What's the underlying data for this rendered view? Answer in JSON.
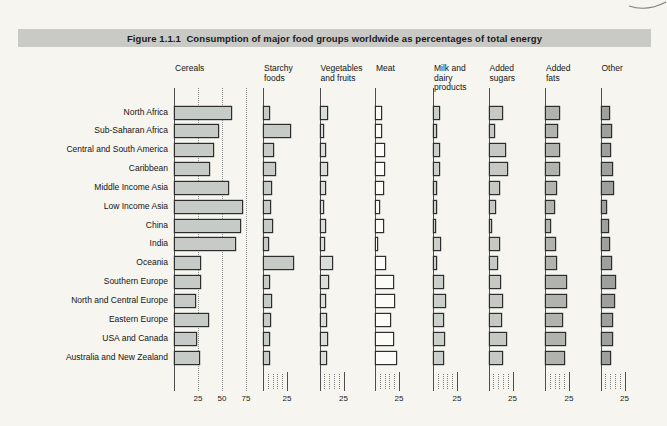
{
  "figure": {
    "title": "Figure 1.1.1  Consumption of major food groups worldwide as percentages of total energy"
  },
  "chart_data": {
    "type": "bar",
    "orientation": "horizontal",
    "unit": "% of total energy",
    "layout": "small-multiples, one column per food group, shared region rows",
    "categories": [
      "North Africa",
      "Sub-Saharan Africa",
      "Central and South America",
      "Caribbean",
      "Middle Income Asia",
      "Low Income Asia",
      "China",
      "India",
      "Oceania",
      "Southern Europe",
      "North and Central Europe",
      "Eastern Europe",
      "USA and Canada",
      "Australia and New Zealand"
    ],
    "series": [
      {
        "name": "Cereals",
        "label": "Cereals",
        "fill": "#c7cbc7",
        "axis_max": 80,
        "tick_labels": [
          25,
          50,
          75
        ],
        "values": [
          58,
          45,
          40,
          35,
          55,
          70,
          68,
          62,
          26,
          26,
          21,
          34,
          22,
          25
        ]
      },
      {
        "name": "Starchy foods",
        "label": "Starchy\nfoods",
        "fill": "#c7cbc7",
        "axis_max": 32,
        "tick_labels": [
          25
        ],
        "values": [
          5,
          27,
          9,
          11,
          7,
          6,
          8,
          4,
          30,
          5,
          7,
          6,
          5,
          5
        ]
      },
      {
        "name": "Vegetables and fruits",
        "label": "Vegetables\nand fruits",
        "fill": "#dadeda",
        "axis_max": 32,
        "tick_labels": [
          25
        ],
        "values": [
          7,
          3,
          5,
          7,
          5,
          3,
          5,
          4,
          12,
          8,
          5,
          6,
          7,
          6
        ]
      },
      {
        "name": "Meat",
        "label": "Meat",
        "fill": "#fbfbf7",
        "axis_max": 32,
        "tick_labels": [
          25
        ],
        "values": [
          5,
          5,
          8,
          8,
          7,
          3,
          7,
          1,
          9,
          18,
          19,
          15,
          18,
          21
        ]
      },
      {
        "name": "Milk and dairy products",
        "label": "Milk and\ndairy\nproducts",
        "fill": "#cbcfcb",
        "axis_max": 32,
        "tick_labels": [
          25
        ],
        "values": [
          5,
          2,
          5,
          5,
          2,
          2,
          1,
          6,
          2,
          9,
          11,
          9,
          10,
          9
        ]
      },
      {
        "name": "Added sugars",
        "label": "Added\nsugars",
        "fill": "#c6c8c4",
        "axis_max": 32,
        "tick_labels": [
          25
        ],
        "values": [
          13,
          5,
          16,
          18,
          10,
          6,
          2,
          10,
          8,
          11,
          13,
          12,
          17,
          13
        ]
      },
      {
        "name": "Added fats",
        "label": "Added\nfats",
        "fill": "#b1b3af",
        "axis_max": 32,
        "tick_labels": [
          25
        ],
        "values": [
          14,
          11,
          14,
          14,
          10,
          8,
          4,
          9,
          10,
          21,
          21,
          17,
          20,
          19
        ]
      },
      {
        "name": "Other",
        "label": "Other",
        "fill": "#9da09c",
        "axis_max": 32,
        "tick_labels": [
          25
        ],
        "values": [
          8,
          10,
          9,
          11,
          12,
          5,
          7,
          8,
          10,
          14,
          13,
          11,
          11,
          9
        ]
      }
    ],
    "minor_ticks_non_cereal_columns": [
      5,
      10,
      15,
      20
    ],
    "grid": "dotted vertical gridlines at 25, 50, 75 in Cereals column only",
    "colors": {
      "page_background": "#f6f5ef",
      "title_band": "#c9c9c5",
      "bar_outline": "#2d2d2d",
      "axis": "#4d4d4d"
    }
  }
}
